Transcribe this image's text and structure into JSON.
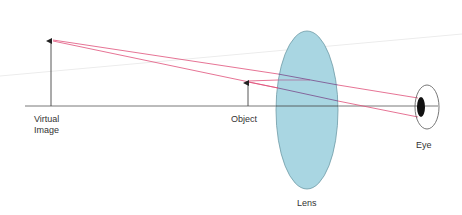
{
  "diagram": {
    "labels": {
      "virtual_image_line1": "Virtual",
      "virtual_image_line2": "Image",
      "object": "Object",
      "lens": "Lens",
      "eye": "Eye"
    },
    "colors": {
      "background": "#ffffff",
      "axis": "#555555",
      "arrow": "#444444",
      "ray": "#e0507a",
      "ray_in_lens": "#7a4a8a",
      "lens_fill": "#a9d6e2",
      "lens_stroke": "#6f9aa6",
      "eye_stroke": "#555555",
      "pupil": "#111111",
      "artifact_line": "#ececec"
    },
    "geometry": {
      "axis": {
        "x1": 25,
        "y1": 106,
        "x2": 438,
        "y2": 106
      },
      "virtual_image_arrow": {
        "x": 51,
        "y_base": 106,
        "y_tip": 40
      },
      "object_arrow": {
        "x": 248,
        "y_base": 106,
        "y_tip": 82
      },
      "lens": {
        "cx": 307,
        "cy": 110,
        "rx": 31,
        "ry": 79
      },
      "eye": {
        "cx": 427,
        "cy": 107,
        "rx": 12,
        "ry": 22
      },
      "pupil": {
        "cx": 421,
        "cy": 107,
        "rx": 4,
        "ry": 10
      }
    }
  }
}
